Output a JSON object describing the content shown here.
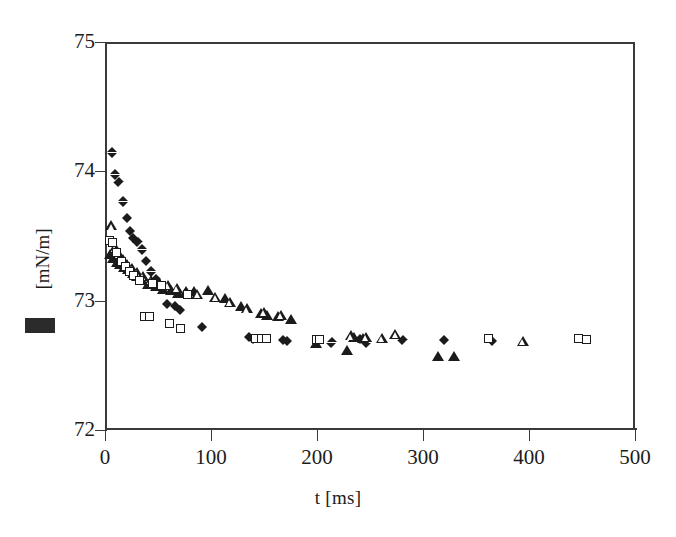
{
  "chart_data": {
    "type": "scatter",
    "title": "",
    "xlabel": "t [ms]",
    "ylabel": "[mN/m]",
    "ylabel_prefix_redacted": true,
    "xlim": [
      0,
      500
    ],
    "ylim": [
      72,
      75
    ],
    "xticks": [
      0,
      100,
      200,
      300,
      400,
      500
    ],
    "yticks": [
      72,
      73,
      74,
      75
    ],
    "grid": false,
    "legend": "none",
    "series": [
      {
        "name": "filled-diamond",
        "marker": "filled diamond",
        "color": "#1b1b1b",
        "points": [
          [
            7,
            74.15
          ],
          [
            10,
            73.98
          ],
          [
            13,
            73.92
          ],
          [
            17,
            73.77
          ],
          [
            21,
            73.64
          ],
          [
            24,
            73.54
          ],
          [
            27,
            73.49
          ],
          [
            31,
            73.46
          ],
          [
            35,
            73.4
          ],
          [
            39,
            73.31
          ],
          [
            44,
            73.23
          ],
          [
            48,
            73.17
          ],
          [
            53,
            73.1
          ],
          [
            59,
            72.98
          ],
          [
            66,
            72.96
          ],
          [
            71,
            72.93
          ],
          [
            92,
            72.8
          ],
          [
            136,
            72.72
          ],
          [
            140,
            72.71
          ],
          [
            168,
            72.7
          ],
          [
            172,
            72.69
          ],
          [
            214,
            72.68
          ],
          [
            241,
            72.71
          ],
          [
            247,
            72.68
          ],
          [
            281,
            72.7
          ],
          [
            320,
            72.7
          ],
          [
            365,
            72.69
          ]
        ]
      },
      {
        "name": "filled-triangle",
        "marker": "filled triangle",
        "color": "#1b1b1b",
        "points": [
          [
            5,
            73.36
          ],
          [
            8,
            73.33
          ],
          [
            11,
            73.3
          ],
          [
            14,
            73.28
          ],
          [
            18,
            73.26
          ],
          [
            22,
            73.24
          ],
          [
            26,
            73.21
          ],
          [
            30,
            73.19
          ],
          [
            35,
            73.16
          ],
          [
            41,
            73.13
          ],
          [
            48,
            73.11
          ],
          [
            55,
            73.09
          ],
          [
            62,
            73.08
          ],
          [
            69,
            73.06
          ],
          [
            76,
            73.07
          ],
          [
            84,
            73.07
          ],
          [
            97,
            73.08
          ],
          [
            113,
            73.02
          ],
          [
            128,
            72.96
          ],
          [
            147,
            72.9
          ],
          [
            153,
            72.89
          ],
          [
            163,
            72.88
          ],
          [
            175,
            72.86
          ],
          [
            199,
            72.67
          ],
          [
            228,
            72.62
          ],
          [
            235,
            72.72
          ],
          [
            243,
            72.71
          ],
          [
            314,
            72.57
          ],
          [
            329,
            72.57
          ]
        ]
      },
      {
        "name": "open-triangle",
        "marker": "open triangle",
        "color": "#1b1b1b",
        "points": [
          [
            6,
            73.58
          ],
          [
            9,
            73.41
          ],
          [
            13,
            73.36
          ],
          [
            17,
            73.32
          ],
          [
            21,
            73.28
          ],
          [
            25,
            73.25
          ],
          [
            30,
            73.22
          ],
          [
            36,
            73.19
          ],
          [
            43,
            73.16
          ],
          [
            51,
            73.14
          ],
          [
            59,
            73.12
          ],
          [
            68,
            73.1
          ],
          [
            77,
            73.06
          ],
          [
            87,
            73.05
          ],
          [
            104,
            73.03
          ],
          [
            118,
            72.99
          ],
          [
            134,
            72.94
          ],
          [
            150,
            72.91
          ],
          [
            166,
            72.89
          ],
          [
            232,
            72.73
          ],
          [
            246,
            72.72
          ],
          [
            261,
            72.71
          ],
          [
            274,
            72.74
          ],
          [
            394,
            72.69
          ]
        ]
      },
      {
        "name": "open-square",
        "marker": "open square",
        "color": "#1b1b1b",
        "points": [
          [
            5,
            73.46
          ],
          [
            8,
            73.44
          ],
          [
            12,
            73.37
          ],
          [
            16,
            73.3
          ],
          [
            20,
            73.26
          ],
          [
            24,
            73.22
          ],
          [
            28,
            73.19
          ],
          [
            33,
            73.15
          ],
          [
            38,
            72.87
          ],
          [
            43,
            72.87
          ],
          [
            46,
            73.13
          ],
          [
            54,
            73.11
          ],
          [
            62,
            72.82
          ],
          [
            72,
            72.78
          ],
          [
            79,
            73.04
          ],
          [
            143,
            72.7
          ],
          [
            148,
            72.7
          ],
          [
            153,
            72.7
          ],
          [
            200,
            72.69
          ],
          [
            203,
            72.69
          ],
          [
            363,
            72.7
          ],
          [
            447,
            72.7
          ],
          [
            455,
            72.69
          ]
        ]
      }
    ]
  },
  "axis": {
    "xtick_labels": [
      "0",
      "100",
      "200",
      "300",
      "400",
      "500"
    ],
    "ytick_labels": [
      "72",
      "73",
      "74",
      "75"
    ],
    "x_title": "t [ms]",
    "y_title": "[mN/m]"
  }
}
